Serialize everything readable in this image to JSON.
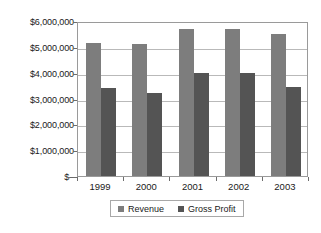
{
  "chart_data": {
    "type": "bar",
    "title": "",
    "subtitle": "",
    "xlabel": "",
    "ylabel": "",
    "categories": [
      "1999",
      "2000",
      "2001",
      "2002",
      "2003"
    ],
    "series": [
      {
        "name": "Revenue",
        "color": "#7d7d7d",
        "values": [
          5150000,
          5100000,
          5700000,
          5700000,
          5500000
        ]
      },
      {
        "name": "Gross Profit",
        "color": "#545454",
        "values": [
          3400000,
          3230000,
          4000000,
          4000000,
          3450000
        ]
      }
    ],
    "ylim": [
      0,
      6000000
    ],
    "ytick_values": [
      0,
      1000000,
      2000000,
      3000000,
      4000000,
      5000000,
      6000000
    ],
    "ytick_labels": [
      "$–",
      "$1,000,000",
      "$2,000,000",
      "$3,000,000",
      "$4,000,000",
      "$5,000,000",
      "$6,000,000"
    ],
    "grid": true,
    "grid_axis": "y",
    "legend_position": "bottom",
    "plot_border": true
  },
  "legend": {
    "entries": [
      {
        "label": "Revenue",
        "color": "#7d7d7d"
      },
      {
        "label": "Gross Profit",
        "color": "#545454"
      }
    ]
  },
  "colors": {
    "revenue": "#7d7d7d",
    "gross_profit": "#545454",
    "gridline": "#b9b9b9",
    "frame": "#9a9a9a",
    "text": "#1a1a1a",
    "background": "#ffffff"
  }
}
